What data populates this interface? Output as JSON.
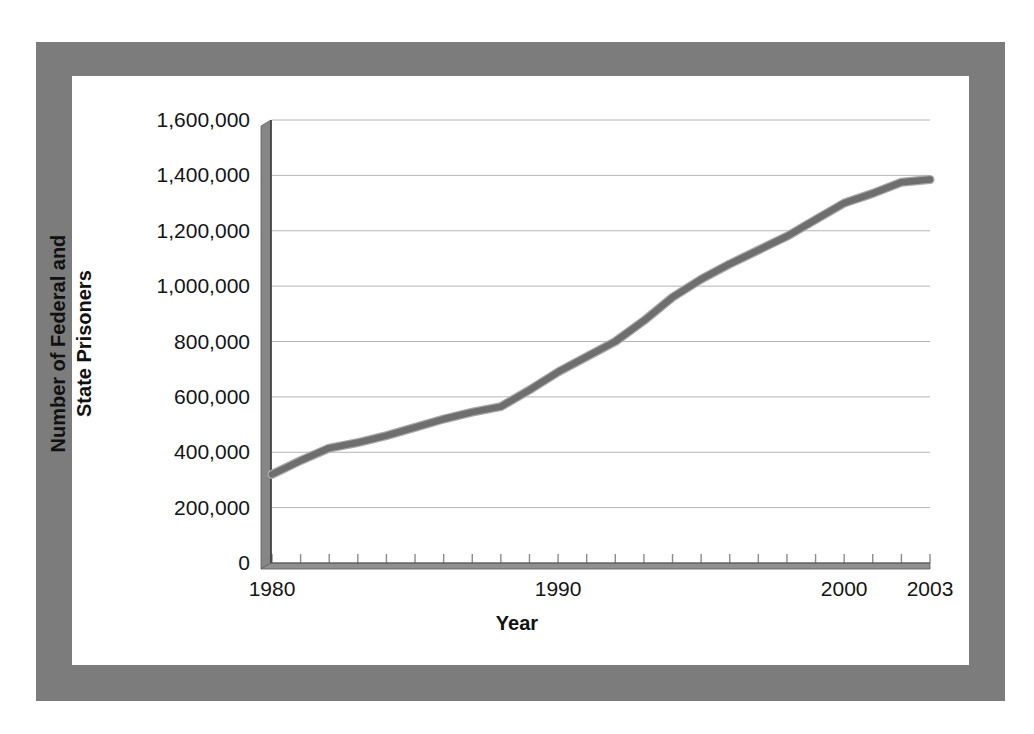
{
  "figure": {
    "frame_color": "#7c7c7c",
    "background_color": "#ffffff",
    "plot_background_color": "#ffffff",
    "axis_color": "#8a8a8a",
    "gridline_color": "#b4b4b4",
    "series_color": "#6e6e6e"
  },
  "chart_data": {
    "type": "line",
    "title": "",
    "subtitle": "",
    "xlabel": "Year",
    "ylabel": "Number of Federal and State Prisoners",
    "ylabel_lines": [
      "Number of Federal and",
      "State Prisoners"
    ],
    "grid": true,
    "legend": "none",
    "xlim": [
      1980,
      2003
    ],
    "ylim": [
      0,
      1600000
    ],
    "ytick_step": 200000,
    "ytick_labels": [
      "0",
      "200,000",
      "400,000",
      "600,000",
      "800,000",
      "1,000,000",
      "1,200,000",
      "1,400,000",
      "1,600,000"
    ],
    "ytick_values": [
      0,
      200000,
      400000,
      600000,
      800000,
      1000000,
      1200000,
      1400000,
      1600000
    ],
    "xtick_labels": [
      "1980",
      "1990",
      "2000",
      "2003"
    ],
    "xtick_label_values": [
      1980,
      1990,
      2000,
      2003
    ],
    "xtick_minor_values": [
      1980,
      1981,
      1982,
      1983,
      1984,
      1985,
      1986,
      1987,
      1988,
      1989,
      1990,
      1991,
      1992,
      1993,
      1994,
      1995,
      1996,
      1997,
      1998,
      1999,
      2000,
      2001,
      2002,
      2003
    ],
    "series": [
      {
        "name": "Number of Federal and State Prisoners",
        "x": [
          1980,
          1981,
          1982,
          1983,
          1984,
          1985,
          1986,
          1987,
          1988,
          1989,
          1990,
          1991,
          1992,
          1993,
          1994,
          1995,
          1996,
          1997,
          1998,
          1999,
          2000,
          2001,
          2002,
          2003
        ],
        "values": [
          320000,
          370000,
          415000,
          435000,
          460000,
          490000,
          520000,
          545000,
          565000,
          625000,
          690000,
          745000,
          800000,
          875000,
          960000,
          1025000,
          1080000,
          1130000,
          1180000,
          1240000,
          1300000,
          1335000,
          1375000,
          1385000
        ]
      }
    ]
  }
}
